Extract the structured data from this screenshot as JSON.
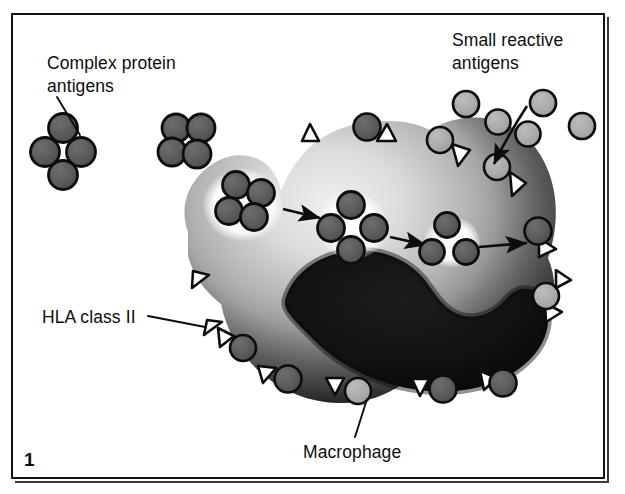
{
  "figure": {
    "number": "1",
    "domain": "immunology-diagram",
    "caption_labels": {
      "complex_protein_antigens": "Complex protein\nantigens",
      "small_reactive_antigens": "Small reactive\nantigens",
      "hla_class_ii": "HLA class II",
      "macrophage": "Macrophage"
    },
    "colors": {
      "background": "#ffffff",
      "frame_stroke": "#111111",
      "outline": "#0d0d0d",
      "complex_antigen_fill": "#5a5a5a",
      "small_antigen_fill": "#a9a9a9",
      "cytoplasm_light": "#d9d9d9",
      "cytoplasm_mid": "#7a7a7a",
      "cytoplasm_dark": "#2a2a2a",
      "nucleus": "#101010",
      "vesicle_halo": "#ffffff",
      "text": "#0d0d0d"
    },
    "geometry": {
      "width": 625,
      "height": 494,
      "frame": {
        "x": 11,
        "y": 13,
        "w": 594,
        "h": 466
      }
    },
    "cell": {
      "name": "macrophage",
      "outline_path": "M 188 232 C 178 205 190 178 214 163 C 232 152 252 153 266 164 C 274 171 279 181 281 191 C 288 173 299 155 316 142 C 336 127 362 120 389 121 C 404 121 418 124 430 130 C 447 120 468 115 489 119 C 516 124 537 143 547 168 C 559 196 558 229 548 258 C 558 281 556 309 543 331 C 528 356 503 373 475 381 C 452 388 427 388 404 383 C 386 396 364 403 341 403 C 310 403 281 391 259 371 C 239 353 226 329 221 304 C 205 292 193 275 188 256 Z",
      "nucleus_path": "M 285 300 C 296 274 322 257 352 254 C 383 251 412 264 428 288 C 438 303 448 314 463 317 C 480 320 495 312 506 299 C 518 285 537 288 543 305 C 550 325 541 348 524 363 C 499 385 463 393 428 390 C 385 386 344 368 316 340 C 297 321 284 310 285 300 Z",
      "phagocytic_cup": {
        "cx": 243,
        "cy": 205,
        "rx": 38,
        "ry": 34
      }
    },
    "complex_antigen_clusters": [
      {
        "id": "free-left",
        "cx": 63,
        "cy": 150,
        "r": 14.5,
        "location": "extracellular",
        "label_target": true
      },
      {
        "id": "free-top",
        "cx": 186,
        "cy": 142,
        "r": 14.0,
        "location": "extracellular",
        "label_target": false
      },
      {
        "id": "in-cup",
        "cx": 241,
        "cy": 204,
        "r": 13.0,
        "location": "phagocytic-cup",
        "label_target": false
      },
      {
        "id": "in-phagosome",
        "cx": 353,
        "cy": 226,
        "r": 13.5,
        "location": "phagosome",
        "label_target": false
      }
    ],
    "vesicles": [
      {
        "id": "phagocytic-cup-halo",
        "cx": 243,
        "cy": 205,
        "r": 38
      },
      {
        "id": "phagosome-halo",
        "cx": 353,
        "cy": 226,
        "r": 33
      },
      {
        "id": "peptide-halo",
        "cx": 454,
        "cy": 243,
        "r": 26
      }
    ],
    "processed_peptides": [
      {
        "cx": 443,
        "cy": 227,
        "r": 12.5
      },
      {
        "cx": 434,
        "cy": 253,
        "r": 12.5
      },
      {
        "cx": 466,
        "cy": 250,
        "r": 12.5
      }
    ],
    "small_antigens_free": [
      {
        "cx": 467,
        "cy": 102,
        "r": 13.0
      },
      {
        "cx": 499,
        "cy": 117,
        "r": 12.5
      },
      {
        "cx": 543,
        "cy": 101,
        "r": 13.0
      },
      {
        "cx": 528,
        "cy": 130,
        "r": 12.5
      },
      {
        "cx": 580,
        "cy": 123,
        "r": 13.0
      },
      {
        "cx": 500,
        "cy": 166,
        "r": 12.5
      }
    ],
    "membrane_units": [
      {
        "id": "m01",
        "tri_x": 310,
        "tri_y": 128,
        "rot": 10,
        "antigen": null,
        "note": "empty HLA, top-left dome"
      },
      {
        "id": "m02",
        "tri_x": 385,
        "tri_y": 130,
        "rot": 15,
        "antigen": "complex",
        "ax": 368,
        "ay": 124
      },
      {
        "id": "m03",
        "tri_x": 462,
        "tri_y": 152,
        "rot": 48,
        "antigen": "small",
        "ax": 443,
        "ay": 140
      },
      {
        "id": "m04",
        "tri_x": 520,
        "tri_y": 183,
        "rot": 78,
        "antigen": "small",
        "ax": 504,
        "ay": 166
      },
      {
        "id": "m05",
        "tri_x": 545,
        "tri_y": 238,
        "rot": 96,
        "antigen": "complex",
        "ax": 538,
        "ay": 216
      },
      {
        "id": "m06",
        "tri_x": 549,
        "tri_y": 305,
        "rot": 112,
        "antigen": "small",
        "ax": 549,
        "ay": 285
      },
      {
        "id": "m07",
        "tri_x": 513,
        "tri_y": 364,
        "rot": 150,
        "antigen": "complex",
        "ax": 498,
        "ay": 375
      },
      {
        "id": "m08",
        "tri_x": 444,
        "tri_y": 390,
        "rot": 178,
        "antigen": "complex",
        "ax": 421,
        "ay": 391
      },
      {
        "id": "m09",
        "tri_x": 358,
        "tri_y": 393,
        "rot": 188,
        "antigen": "small",
        "ax": 341,
        "ay": 388
      },
      {
        "id": "m10",
        "tri_x": 275,
        "tri_y": 380,
        "rot": 205,
        "antigen": "complex",
        "ax": 289,
        "ay": 382
      },
      {
        "id": "m11",
        "tri_x": 210,
        "tri_y": 332,
        "rot": 248,
        "antigen": "complex",
        "ax": 228,
        "ay": 340
      },
      {
        "id": "m12",
        "tri_x": 198,
        "tri_y": 275,
        "rot": 262,
        "antigen": null,
        "label_target": true
      },
      {
        "id": "m13",
        "tri_x": 189,
        "tri_y": 230,
        "rot": 272,
        "antigen": null
      },
      {
        "id": "m14",
        "tri_x": 568,
        "tri_y": 278,
        "rot": 108,
        "antigen": null
      }
    ],
    "arrows": [
      {
        "id": "uptake-arrow",
        "x1": 281,
        "y1": 208,
        "x2": 321,
        "y2": 218,
        "type": "process"
      },
      {
        "id": "processing-arrow",
        "x1": 388,
        "y1": 236,
        "x2": 424,
        "y2": 244,
        "type": "process"
      },
      {
        "id": "presentation-arrow",
        "x1": 478,
        "y1": 247,
        "x2": 524,
        "y2": 243,
        "type": "process"
      },
      {
        "id": "small-antigen-pointer",
        "type": "curved-pointer",
        "path": "M 527 109 C 512 128 500 146 491 166"
      }
    ],
    "leader_lines": [
      {
        "id": "leader-complex-protein",
        "x1": 80,
        "y1": 133,
        "x2": 58,
        "y2": 96,
        "for": "complex_protein_antigens"
      },
      {
        "id": "leader-hla",
        "x1": 145,
        "y1": 315,
        "x2": 203,
        "y2": 327,
        "for": "hla_class_ii"
      },
      {
        "id": "leader-macrophage",
        "x1": 357,
        "y1": 436,
        "x2": 368,
        "y2": 399,
        "for": "macrophage"
      }
    ]
  }
}
